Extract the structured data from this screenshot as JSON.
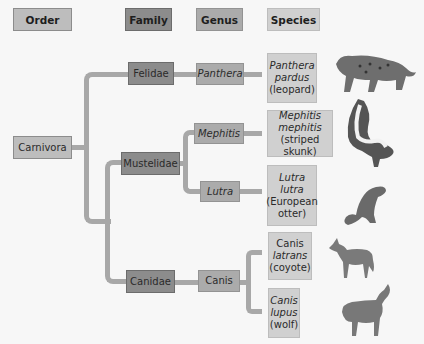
{
  "headers": {
    "order": "Order",
    "family": "Family",
    "genus": "Genus",
    "species": "Species"
  },
  "order": {
    "label": "Carnivora"
  },
  "families": [
    {
      "label": "Felidae"
    },
    {
      "label": "Mustelidae"
    },
    {
      "label": "Canidae"
    }
  ],
  "genera": [
    {
      "label": "Panthera"
    },
    {
      "label": "Mephitis"
    },
    {
      "label": "Lutra"
    },
    {
      "label": "Canis"
    }
  ],
  "species": [
    {
      "line1": "Panthera",
      "line2": "pardus",
      "common": "(leopard)",
      "animal_icon": "leopard-illustration"
    },
    {
      "line1": "Mephitis",
      "line2": "mephitis",
      "common": "(striped skunk)",
      "animal_icon": "skunk-illustration"
    },
    {
      "line1": "Lutra",
      "line2": "lutra",
      "common": "(European",
      "common2": "otter)",
      "animal_icon": "otter-illustration"
    },
    {
      "line1": "Canis",
      "line2": "latrans",
      "common": "(coyote)",
      "animal_icon": "coyote-illustration"
    },
    {
      "line1": "Canis",
      "line2": "lupus",
      "common": "(wolf)",
      "animal_icon": "wolf-illustration"
    }
  ],
  "colors": {
    "order": "#bdbdbd",
    "family": "#8c8c8c",
    "genus": "#ababab",
    "species": "#d0d0d0",
    "connector": "#a8a8a8"
  }
}
